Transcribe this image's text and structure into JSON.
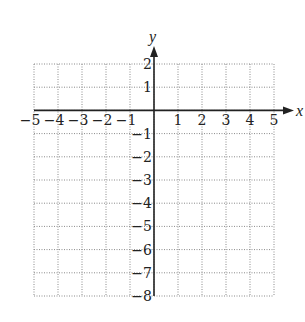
{
  "chart_data": {
    "type": "table",
    "title": "",
    "xlabel": "x",
    "ylabel": "y",
    "xlim": [
      -5,
      5
    ],
    "ylim": [
      -8,
      2
    ],
    "x_ticks": [
      -5,
      -4,
      -3,
      -2,
      -1,
      1,
      2,
      3,
      4,
      5
    ],
    "y_ticks": [
      2,
      1,
      -1,
      -2,
      -3,
      -4,
      -5,
      -6,
      -7,
      -8
    ],
    "x_tick_labels": [
      "−5",
      "−4",
      "−3",
      "−2",
      "−1",
      "1",
      "2",
      "3",
      "4",
      "5"
    ],
    "y_tick_labels": [
      "2",
      "1",
      "−1",
      "−2",
      "−3",
      "−4",
      "−5",
      "−6",
      "−7",
      "−8"
    ],
    "grid": true,
    "grid_style": "dotted",
    "series": []
  },
  "colors": {
    "axis": "#222222",
    "grid": "#8a8a8a",
    "background": "#ffffff"
  },
  "layout": {
    "x0_px": 154,
    "y0_px": 110.4,
    "px_per_x": 24,
    "px_per_y": 23.2
  }
}
